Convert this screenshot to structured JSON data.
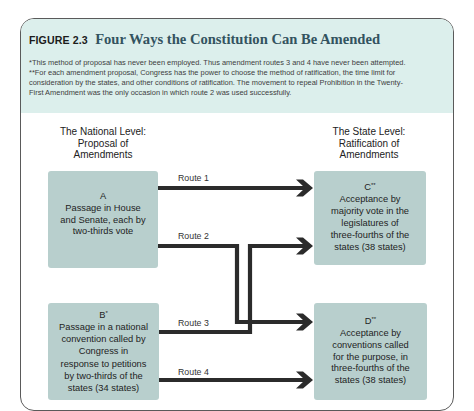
{
  "figure": {
    "label": "FIGURE 2.3",
    "title": "Four Ways the Constitution Can Be Amended"
  },
  "footnotes": [
    {
      "lines": [
        "*This method of proposal has never been employed. Thus amendment routes 3 and 4 have never been attempted."
      ]
    },
    {
      "lines": [
        "**For each amendment proposal, Congress has the power to choose the method of ratification, the time limit for",
        "consideration by the states, and other conditions of ratification. The movement to repeal Prohibition in the Twenty-",
        "First Amendment was the only occasion in which route 2 was used successfully."
      ]
    }
  ],
  "diagram": {
    "national_header": [
      "The National Level:",
      "Proposal of",
      "Amendments"
    ],
    "state_header": [
      "The State Level:",
      "Ratification of",
      "Amendments"
    ],
    "proposal_methods": [
      {
        "id": "A",
        "mark": "",
        "lines": [
          "Passage in House",
          "and Senate, each by",
          "two-thirds vote"
        ]
      },
      {
        "id": "B",
        "mark": "*",
        "lines": [
          "Passage in a national",
          "convention called by",
          "Congress in",
          "response to petitions",
          "by two-thirds of the",
          "states (34 states)"
        ]
      }
    ],
    "ratification_methods": [
      {
        "id": "C",
        "mark": "**",
        "lines": [
          "Acceptance by",
          "majority vote in the",
          "legislatures of",
          "three-fourths of the",
          "states (38 states)"
        ]
      },
      {
        "id": "D",
        "mark": "**",
        "lines": [
          "Acceptance by",
          "conventions called",
          "for the purpose, in",
          "three-fourths of the",
          "states (38 states)"
        ]
      }
    ],
    "routes": [
      {
        "label": "Route 1",
        "from": "A",
        "to": "C"
      },
      {
        "label": "Route 2",
        "from": "A",
        "to": "D"
      },
      {
        "label": "Route 3",
        "from": "B",
        "to": "C"
      },
      {
        "label": "Route 4",
        "from": "B",
        "to": "D"
      }
    ]
  },
  "colors": {
    "header_background": "#dcefec",
    "box_fill": "#b8cfcd",
    "route_line": "#2b2b2b",
    "title_text": "#33535f",
    "frame_border": "#5a5a5a"
  }
}
